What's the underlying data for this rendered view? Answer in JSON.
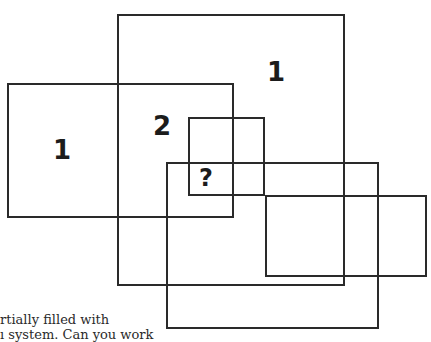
{
  "diagram": {
    "type": "overlapping-rectangles-puzzle",
    "rectangles": [
      {
        "id": "big-top",
        "x": 117,
        "y": 14,
        "w": 228,
        "h": 272
      },
      {
        "id": "left",
        "x": 7,
        "y": 83,
        "w": 227,
        "h": 135
      },
      {
        "id": "small-center",
        "x": 188,
        "y": 117,
        "w": 77,
        "h": 79
      },
      {
        "id": "bottom",
        "x": 166,
        "y": 162,
        "w": 213,
        "h": 167
      },
      {
        "id": "right",
        "x": 265,
        "y": 195,
        "w": 162,
        "h": 82
      }
    ],
    "labels": [
      {
        "id": "label-top-right",
        "text": "1"
      },
      {
        "id": "label-left",
        "text": "1"
      },
      {
        "id": "label-overlap",
        "text": "2"
      },
      {
        "id": "label-question",
        "text": "?"
      }
    ]
  },
  "caption": {
    "line1": "rtially filled with",
    "line2": "ı system. Can you work"
  }
}
